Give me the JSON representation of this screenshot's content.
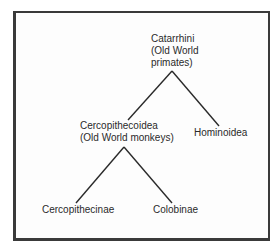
{
  "diagram": {
    "type": "taxonomy-tree",
    "line_color": "#2a2a2a",
    "nodes": {
      "root": {
        "lines": [
          "Catarrhini",
          "(Old World",
          "primates)"
        ]
      },
      "left": {
        "lines": [
          "Cercopithecoidea",
          "(Old World monkeys)"
        ]
      },
      "right": {
        "lines": [
          "Hominoidea"
        ]
      },
      "left_left": {
        "lines": [
          "Cercopithecinae"
        ]
      },
      "left_right": {
        "lines": [
          "Colobinae"
        ]
      }
    },
    "edges": [
      [
        "Catarrhini",
        "Cercopithecoidea"
      ],
      [
        "Catarrhini",
        "Hominoidea"
      ],
      [
        "Cercopithecoidea",
        "Cercopithecinae"
      ],
      [
        "Cercopithecoidea",
        "Colobinae"
      ]
    ]
  }
}
